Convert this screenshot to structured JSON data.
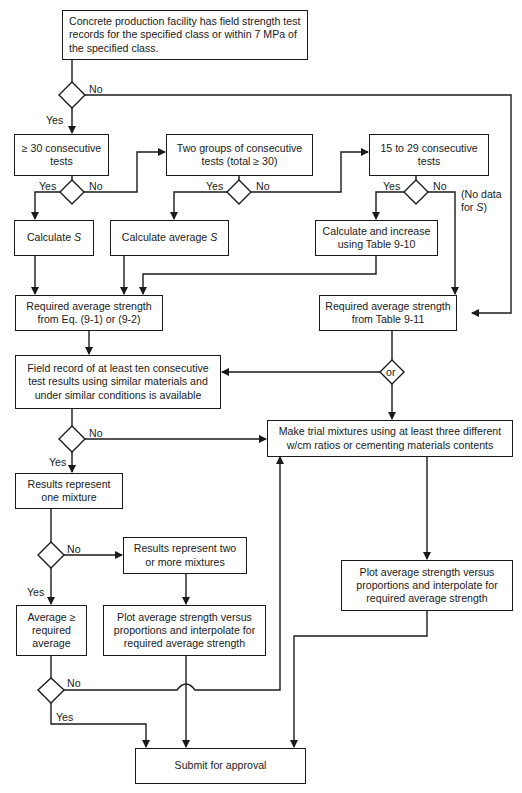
{
  "diagram": {
    "type": "flowchart",
    "nodes": {
      "start": "Concrete production facility has field strength test records for the specified class or within 7 MPa of the specified class.",
      "ge30": "≥ 30 consecutive tests",
      "two_groups": "Two groups of consecutive tests (total ≥ 30)",
      "n15_29": "15 to 29 consecutive tests",
      "calc_s_pre": "Calculate ",
      "calc_s_var": "S",
      "calc_avg_s_pre": "Calculate average ",
      "calc_avg_s_var": "S",
      "calc_increase": "Calculate and increase using Table 9-10",
      "req_avg_eq": "Required average strength from Eq. (9-1) or (9-2)",
      "req_avg_table": "Required average strength from Table 9-11",
      "field_record": "Field record of at least ten consecutive test results using similar materials and under similar conditions is available",
      "trial_mixtures": "Make trial mixtures using at least three different w/cm ratios or cementing materials contents",
      "one_mixture": "Results represent one mixture",
      "two_or_more": "Results represent two or more mixtures",
      "avg_ge_req": "Average ≥ required average",
      "plot_left": "Plot average strength versus proportions and interpolate for required average strength",
      "plot_right": "Plot average strength versus proportions and interpolate for required average strength",
      "submit": "Submit for approval",
      "or_diamond": "or"
    },
    "labels": {
      "yes": "Yes",
      "no": "No",
      "no_data_1": "(No data",
      "no_data_2_pre": "for ",
      "no_data_2_var": "S",
      "no_data_2_post": ")"
    },
    "edges": [
      {
        "from": "start",
        "to": "ge30",
        "label": "Yes"
      },
      {
        "from": "start",
        "to": "req_avg_table",
        "label": "No"
      },
      {
        "from": "ge30",
        "to": "calc_s",
        "label": "Yes"
      },
      {
        "from": "ge30",
        "to": "two_groups",
        "label": "No"
      },
      {
        "from": "two_groups",
        "to": "calc_avg_s",
        "label": "Yes"
      },
      {
        "from": "two_groups",
        "to": "n15_29",
        "label": "No"
      },
      {
        "from": "n15_29",
        "to": "calc_increase",
        "label": "Yes"
      },
      {
        "from": "n15_29",
        "to": "req_avg_table",
        "label": "No (No data for S)"
      },
      {
        "from": "calc_s",
        "to": "req_avg_eq"
      },
      {
        "from": "calc_avg_s",
        "to": "req_avg_eq"
      },
      {
        "from": "calc_increase",
        "to": "req_avg_eq"
      },
      {
        "from": "req_avg_eq",
        "to": "field_record"
      },
      {
        "from": "req_avg_table",
        "to": "field_record",
        "label": "or"
      },
      {
        "from": "req_avg_table",
        "to": "trial_mixtures",
        "label": "or"
      },
      {
        "from": "field_record",
        "to": "one_mixture",
        "label": "Yes"
      },
      {
        "from": "field_record",
        "to": "trial_mixtures",
        "label": "No"
      },
      {
        "from": "one_mixture",
        "to": "avg_ge_req",
        "label": "Yes"
      },
      {
        "from": "one_mixture",
        "to": "two_or_more",
        "label": "No"
      },
      {
        "from": "two_or_more",
        "to": "plot_left"
      },
      {
        "from": "avg_ge_req",
        "to": "submit",
        "label": "Yes"
      },
      {
        "from": "avg_ge_req",
        "to": "trial_mixtures",
        "label": "No"
      },
      {
        "from": "trial_mixtures",
        "to": "plot_right"
      },
      {
        "from": "plot_left",
        "to": "submit"
      },
      {
        "from": "plot_right",
        "to": "submit"
      }
    ]
  }
}
